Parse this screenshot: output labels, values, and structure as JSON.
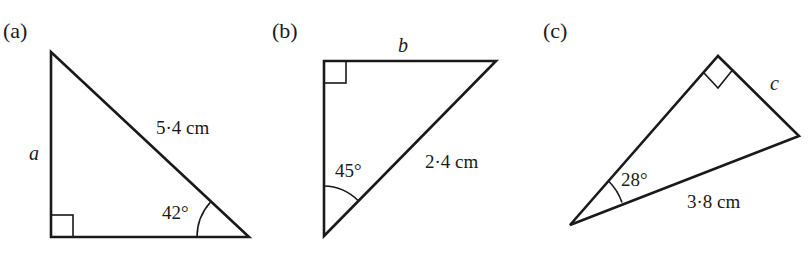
{
  "figure": {
    "triangles": [
      {
        "panel_label": "(a)",
        "unknown_side": "a",
        "given_side": "5·4 cm",
        "given_angle": "42°",
        "right_angle": "bottom-left"
      },
      {
        "panel_label": "(b)",
        "unknown_side": "b",
        "given_side": "2·4 cm",
        "given_angle": "45°",
        "right_angle": "top-left"
      },
      {
        "panel_label": "(c)",
        "unknown_side": "c",
        "given_side": "3·8 cm",
        "given_angle": "28°",
        "right_angle": "top"
      }
    ]
  },
  "colors": {
    "stroke": "#1a1a1a",
    "background": "#ffffff"
  }
}
